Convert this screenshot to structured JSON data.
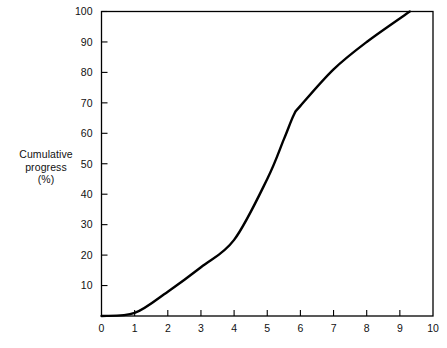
{
  "chart_data": {
    "type": "line",
    "title": "",
    "subtitle": "",
    "xlabel": "",
    "ylabel": "Cumulative progress (%)",
    "ylabel_lines": [
      "Cumulative",
      "progress",
      "(%)"
    ],
    "xlim": [
      0,
      10
    ],
    "ylim": [
      0,
      100
    ],
    "xticks": [
      0,
      1,
      2,
      3,
      4,
      5,
      6,
      7,
      8,
      9,
      10
    ],
    "xtick_labels": [
      "0",
      "1",
      "2",
      "3",
      "4",
      "5",
      "6",
      "7",
      "8",
      "9",
      "10"
    ],
    "yticks": [
      0,
      10,
      20,
      30,
      40,
      50,
      60,
      70,
      80,
      90,
      100
    ],
    "ytick_labels": [
      "",
      "10",
      "20",
      "30",
      "40",
      "50",
      "60",
      "70",
      "80",
      "90",
      "100"
    ],
    "grid": false,
    "legend": null,
    "legend_position": "none",
    "annotations": [],
    "line_color": "#000000",
    "line_width": 2.4,
    "axis_color": "#000000",
    "background_color": "#ffffff",
    "series": [
      {
        "name": "Cumulative progress",
        "x": [
          0,
          1,
          2,
          3,
          4,
          5,
          5.5,
          5.8,
          6,
          7,
          8,
          9.3
        ],
        "y": [
          0,
          1,
          8,
          16,
          25,
          45,
          58,
          66,
          69,
          81,
          90,
          100
        ]
      }
    ]
  },
  "axes": {
    "y_label_line1": "Cumulative",
    "y_label_line2": "progress",
    "y_label_line3": "(%)"
  }
}
